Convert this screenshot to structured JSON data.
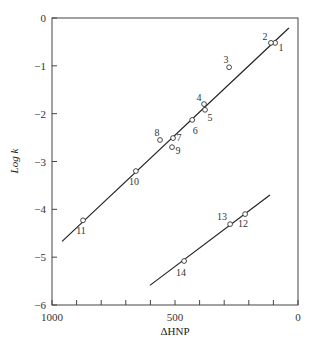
{
  "chart_data": {
    "type": "scatter",
    "title": "",
    "xlabel": "ΔHNP",
    "ylabel": "Log k",
    "xlim": [
      1000,
      0
    ],
    "ylim": [
      -6,
      0
    ],
    "x_ticks": [
      1000,
      900,
      800,
      700,
      600,
      500,
      400,
      300,
      200,
      100,
      0
    ],
    "x_tick_labels": [
      {
        "value": 1000,
        "label": "1000"
      },
      {
        "value": 500,
        "label": "500"
      },
      {
        "value": 0,
        "label": "0"
      }
    ],
    "y_ticks": [
      {
        "value": 0,
        "label": "0"
      },
      {
        "value": -1,
        "label": "−1"
      },
      {
        "value": -2,
        "label": "−2"
      },
      {
        "value": -3,
        "label": "−3"
      },
      {
        "value": -4,
        "label": "−4"
      },
      {
        "value": -5,
        "label": "−5"
      },
      {
        "value": -6,
        "label": "−6"
      }
    ],
    "grid": false,
    "legend": null,
    "points": [
      {
        "label": "1",
        "x": 93,
        "y": -0.52,
        "lx": 6,
        "ly": 5
      },
      {
        "label": "2",
        "x": 110,
        "y": -0.52,
        "lx": -6,
        "ly": -6
      },
      {
        "label": "3",
        "x": 280,
        "y": -1.03,
        "lx": -3,
        "ly": -7
      },
      {
        "label": "4",
        "x": 382,
        "y": -1.8,
        "lx": -5,
        "ly": -6
      },
      {
        "label": "5",
        "x": 378,
        "y": -1.92,
        "lx": 5,
        "ly": 8
      },
      {
        "label": "6",
        "x": 430,
        "y": -2.13,
        "lx": 3,
        "ly": 11
      },
      {
        "label": "7",
        "x": 508,
        "y": -2.51,
        "lx": 6,
        "ly": 0
      },
      {
        "label": "8",
        "x": 561,
        "y": -2.55,
        "lx": -3,
        "ly": -7
      },
      {
        "label": "9",
        "x": 512,
        "y": -2.7,
        "lx": 6,
        "ly": 4
      },
      {
        "label": "10",
        "x": 659,
        "y": -3.2,
        "lx": -2,
        "ly": 11
      },
      {
        "label": "11",
        "x": 874,
        "y": -4.23,
        "lx": -2,
        "ly": 11
      },
      {
        "label": "12",
        "x": 215,
        "y": -4.1,
        "lx": -2,
        "ly": 10
      },
      {
        "label": "13",
        "x": 276,
        "y": -4.31,
        "lx": -8,
        "ly": -7
      },
      {
        "label": "14",
        "x": 463,
        "y": -5.08,
        "lx": -3,
        "ly": 12
      }
    ],
    "series": [
      {
        "name": "upper-fit-line",
        "type": "line",
        "x": [
          959,
          37
        ],
        "y": [
          -4.67,
          -0.21
        ]
      },
      {
        "name": "lower-fit-line",
        "type": "line",
        "x": [
          602,
          114
        ],
        "y": [
          -5.59,
          -3.7
        ]
      }
    ]
  }
}
